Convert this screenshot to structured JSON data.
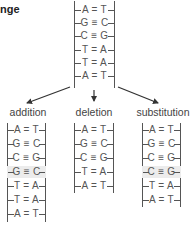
{
  "title": "nge",
  "original": {
    "pairs": [
      "A = T",
      "G ≡ C",
      "C ≡ G",
      "T = A",
      "T = A",
      "A = T"
    ]
  },
  "mutations": [
    {
      "label": "addition",
      "pairs": [
        "A = T",
        "G ≡ C",
        "C ≡ G",
        "G ≡ C",
        "T = A",
        "T = A",
        "A = T"
      ],
      "highlight_index": 3
    },
    {
      "label": "deletion",
      "pairs": [
        "A = T",
        "G ≡ C",
        "C ≡ G",
        "T = A",
        "A = T"
      ],
      "highlight_index": -1
    },
    {
      "label": "substitution",
      "pairs": [
        "A = T",
        "G ≡ C",
        "C ≡ G",
        "C ≡ G",
        "T = A",
        "A = T"
      ],
      "highlight_index": 3
    }
  ],
  "colors": {
    "line": "#555555",
    "highlight": "#ececec",
    "text": "#555555"
  }
}
